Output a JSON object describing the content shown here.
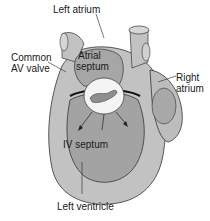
{
  "diagram": {
    "type": "anatomical illustration",
    "labels": {
      "left_atrium": "Left atrium",
      "common_av_valve_line1": "Common",
      "common_av_valve_line2": "AV valve",
      "atrial_septum_line1": "Atrial",
      "atrial_septum_line2": "septum",
      "right_atrium_line1": "Right",
      "right_atrium_line2": "atrium",
      "iv_septum": "IV septum",
      "left_ventricle": "Left ventricle"
    },
    "colors": {
      "outer_wall": "#bdbdbd",
      "inner_chamber": "#9e9e9e",
      "valve": "#f4f4f4",
      "outline": "#222222",
      "background": "#ffffff"
    }
  }
}
